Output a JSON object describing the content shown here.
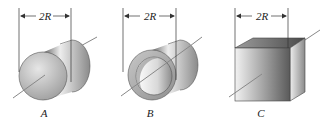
{
  "figure": {
    "shapes": [
      {
        "id": "A",
        "label": "A",
        "kind": "solid-cylinder",
        "dimension": "2R"
      },
      {
        "id": "B",
        "label": "B",
        "kind": "hollow-cylinder",
        "dimension": "2R"
      },
      {
        "id": "C",
        "label": "C",
        "kind": "cube",
        "dimension": "2R"
      }
    ]
  }
}
